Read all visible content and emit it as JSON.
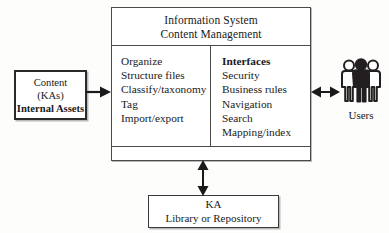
{
  "diagram": {
    "colors": {
      "background": "#fdfdfb",
      "line": "#4a4a4a",
      "text": "#1a1a1a",
      "figure_dark": "#231f20",
      "figure_light": "#ffffff",
      "shadow": "#b9b9b9"
    }
  },
  "main_box": {
    "header": {
      "line1": "Information System",
      "line2": "Content Management"
    },
    "left_column": {
      "items": [
        "Organize",
        "Structure files",
        "Classify/taxonomy",
        "Tag",
        "Import/export"
      ]
    },
    "right_column": {
      "heading": "Interfaces",
      "items": [
        "Security",
        "Business rules",
        "Navigation",
        "Search",
        "Mapping/index"
      ]
    }
  },
  "content_box": {
    "line1": "Content",
    "line2": "(KAs)",
    "line3": "Internal Assets"
  },
  "ka_box": {
    "line1": "KA",
    "line2": "Library or Repository"
  },
  "users": {
    "label": "Users",
    "icon": "users-group-icon",
    "count": 3
  },
  "arrows": [
    {
      "name": "content-to-main",
      "from": "content_box",
      "to": "main_box",
      "direction": "right",
      "bidirectional": false
    },
    {
      "name": "main-to-users",
      "from": "main_box",
      "to": "users",
      "direction": "horizontal",
      "bidirectional": true
    },
    {
      "name": "main-to-ka",
      "from": "main_box",
      "to": "ka_box",
      "direction": "vertical",
      "bidirectional": true
    }
  ]
}
